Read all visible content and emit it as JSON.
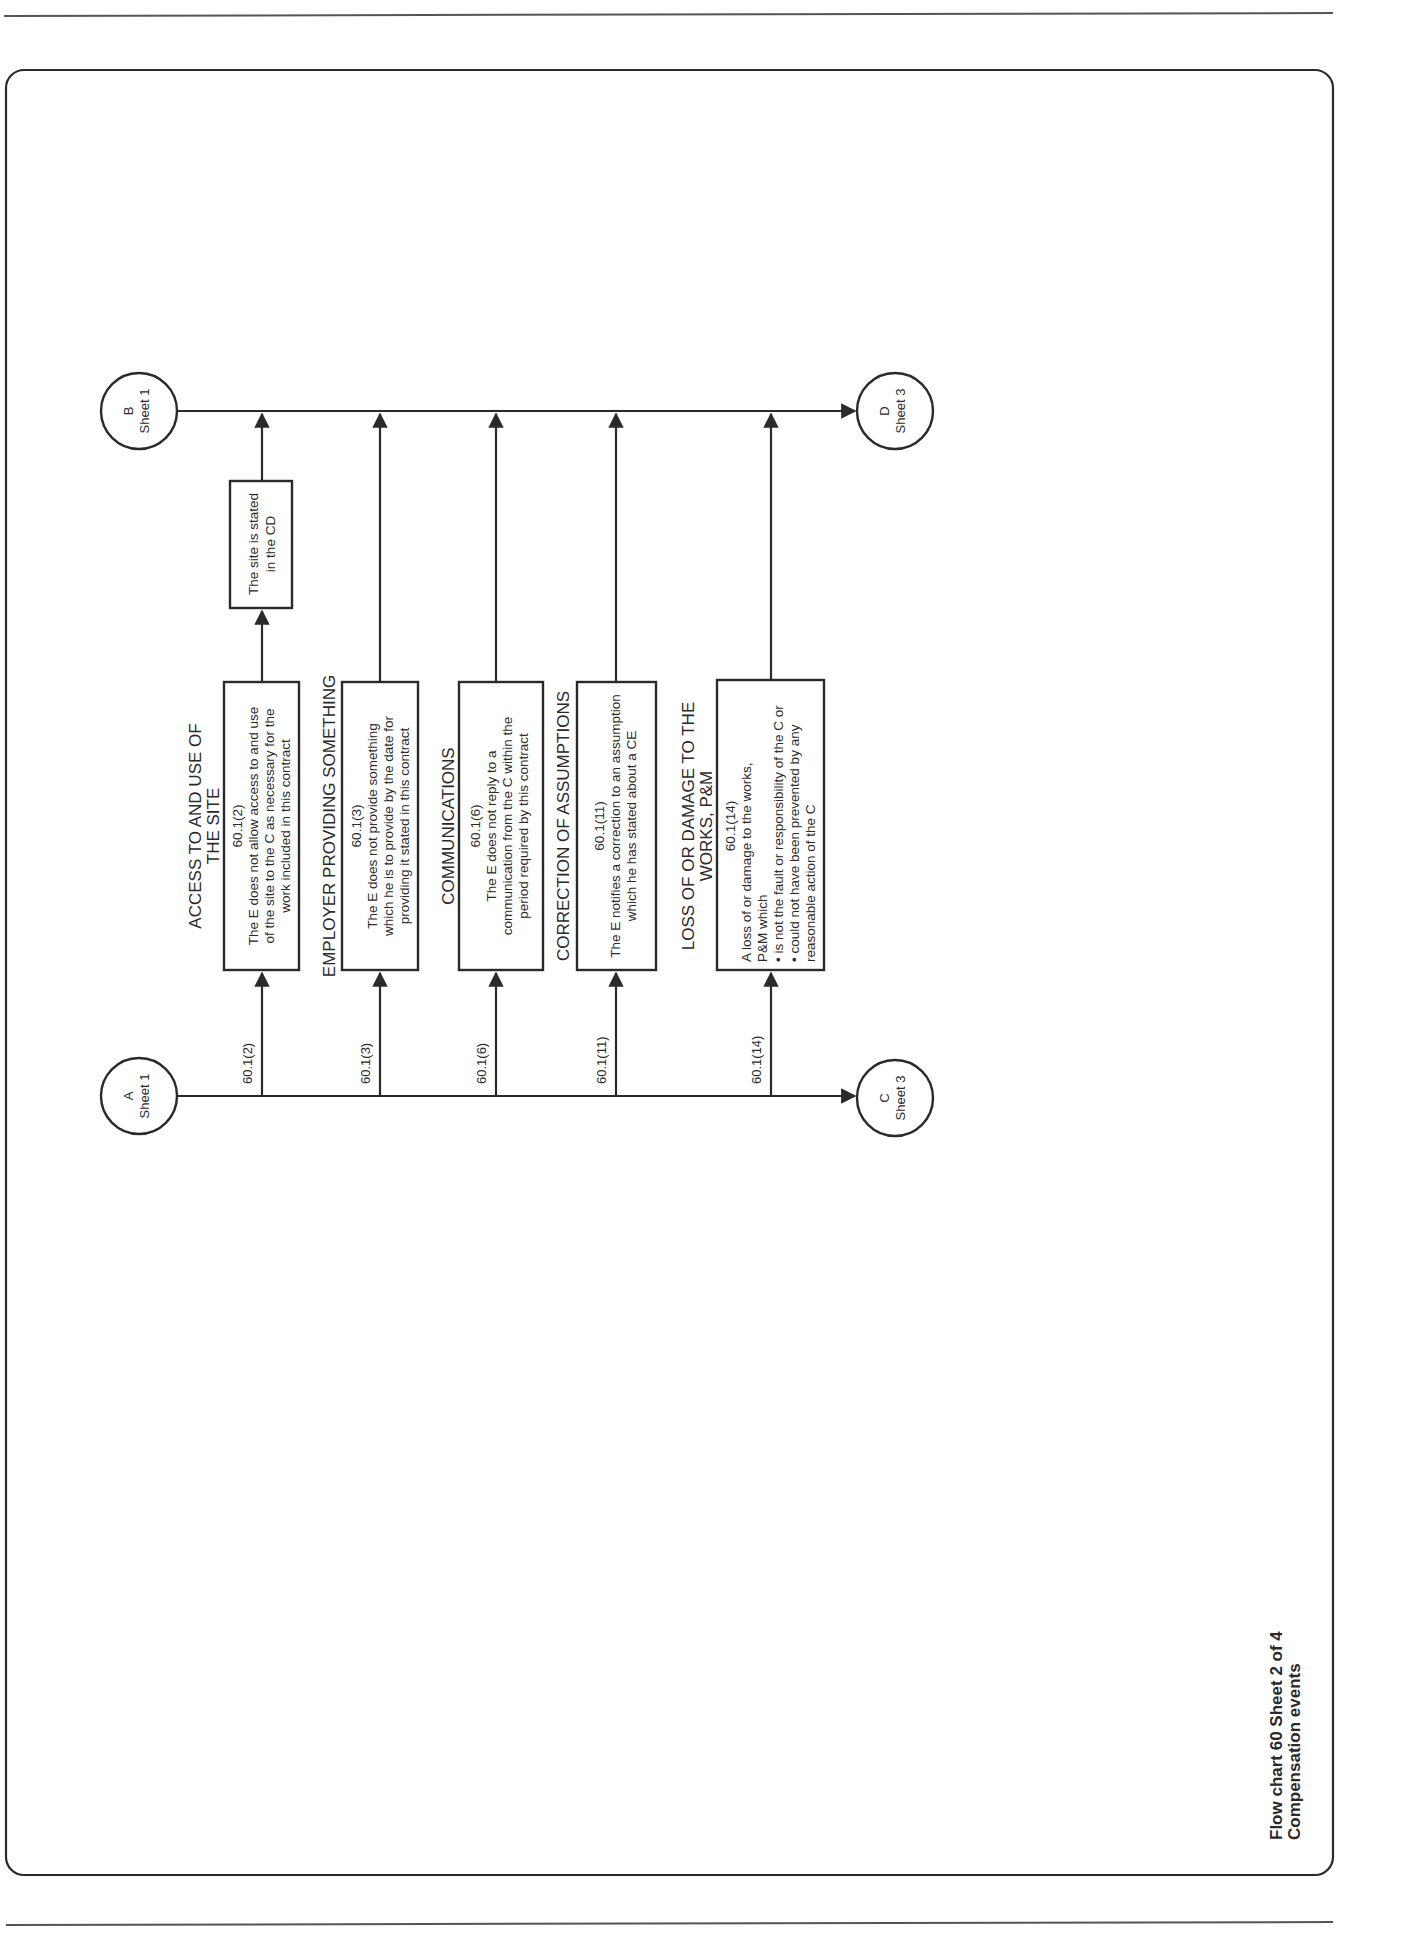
{
  "page": {
    "title_line1": "Flow chart 60 Sheet 2 of 4",
    "title_line2": "Compensation events"
  },
  "connectors": {
    "A": {
      "letter": "A",
      "sheet": "Sheet 1"
    },
    "B": {
      "letter": "B",
      "sheet": "Sheet 1"
    },
    "C": {
      "letter": "C",
      "sheet": "Sheet 3"
    },
    "D": {
      "letter": "D",
      "sheet": "Sheet 3"
    }
  },
  "events": [
    {
      "ref_label": "60.1(2)",
      "heading": [
        "ACCESS TO AND USE OF",
        "THE SITE"
      ],
      "clause": "60.1(2)",
      "text": [
        "The E does not allow access to and use",
        "of the site to the C as necessary for the",
        "work included in this contract"
      ]
    },
    {
      "ref_label": "60.1(3)",
      "heading": [
        "EMPLOYER PROVIDING SOMETHING"
      ],
      "clause": "60.1(3)",
      "text": [
        "The E does not provide something",
        "which he is to provide by the date for",
        "providing it stated in this contract"
      ]
    },
    {
      "ref_label": "60.1(6)",
      "heading": [
        "COMMUNICATIONS"
      ],
      "clause": "60.1(6)",
      "text": [
        "The E does not reply to a",
        "communication from the C within the",
        "period required by this contract"
      ]
    },
    {
      "ref_label": "60.1(11)",
      "heading": [
        "CORRECTION OF ASSUMPTIONS"
      ],
      "clause": "60.1(11)",
      "text": [
        "The E notifies a correction to an assumption",
        "which he has stated about a CE"
      ]
    },
    {
      "ref_label": "60.1(14)",
      "heading": [
        "LOSS OF OR DAMAGE TO THE",
        "WORKS, P&M"
      ],
      "clause": "60.1(14)",
      "text": [
        "A loss of or damage to the works,",
        "P&M which",
        "• is not the fault or responsibility of the C or",
        "• could not have been prevented by any",
        "  reasonable action of the C"
      ]
    }
  ],
  "site_box": {
    "text": [
      "The site is stated",
      "in the CD"
    ]
  }
}
